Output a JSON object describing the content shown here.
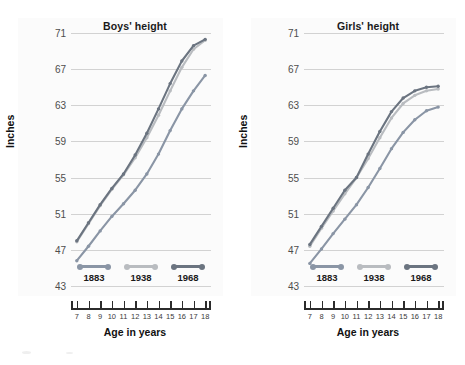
{
  "figure": {
    "background": "#ffffff",
    "panel_background": "#fbfbfb",
    "gridline_color": "#d2d2d2",
    "axis_color": "#2b2b2b"
  },
  "series_colors": {
    "1883": "#8a95a5",
    "1938": "#b9bcc0",
    "1968": "#6b7480"
  },
  "legend": {
    "items": [
      {
        "label": "1883",
        "color": "#8a95a5"
      },
      {
        "label": "1938",
        "color": "#b9bcc0"
      },
      {
        "label": "1968",
        "color": "#6b7480"
      }
    ]
  },
  "axes": {
    "ylabel": "Inches",
    "xlabel": "Age in years",
    "yticks": [
      43,
      47,
      51,
      55,
      59,
      63,
      67,
      71
    ],
    "ylim": [
      43,
      71
    ],
    "xticks": [
      7,
      8,
      9,
      10,
      11,
      12,
      13,
      14,
      15,
      16,
      17,
      18
    ],
    "xlim": [
      6.5,
      18.5
    ]
  },
  "chart_data": [
    {
      "type": "line",
      "title": "Boys' height",
      "xlabel": "Age in years",
      "ylabel": "Inches",
      "ylim": [
        43,
        71
      ],
      "xlim": [
        6.5,
        18.5
      ],
      "grid": true,
      "legend_position": "bottom",
      "x": [
        7,
        8,
        9,
        10,
        11,
        12,
        13,
        14,
        15,
        16,
        17,
        18
      ],
      "series": [
        {
          "name": "1883",
          "color": "#8a95a5",
          "values": [
            45.8,
            47.4,
            49.1,
            50.7,
            52.1,
            53.6,
            55.4,
            57.6,
            60.2,
            62.6,
            64.6,
            66.3
          ]
        },
        {
          "name": "1938",
          "color": "#b9bcc0",
          "values": [
            47.9,
            49.9,
            51.9,
            53.7,
            55.3,
            57.2,
            59.4,
            61.9,
            64.6,
            67.2,
            69.2,
            70.2
          ]
        },
        {
          "name": "1968",
          "color": "#6b7480",
          "values": [
            48.0,
            50.0,
            52.0,
            53.8,
            55.4,
            57.5,
            59.9,
            62.6,
            65.4,
            67.9,
            69.6,
            70.3
          ]
        }
      ]
    },
    {
      "type": "line",
      "title": "Girls' height",
      "xlabel": "Age in years",
      "ylabel": "Inches",
      "ylim": [
        43,
        71
      ],
      "xlim": [
        6.5,
        18.5
      ],
      "grid": true,
      "legend_position": "bottom",
      "x": [
        7,
        8,
        9,
        10,
        11,
        12,
        13,
        14,
        15,
        16,
        17,
        18
      ],
      "series": [
        {
          "name": "1883",
          "color": "#8a95a5",
          "values": [
            45.5,
            47.1,
            48.8,
            50.4,
            52.0,
            53.9,
            56.0,
            58.2,
            60.0,
            61.4,
            62.4,
            62.8
          ]
        },
        {
          "name": "1938",
          "color": "#b9bcc0",
          "values": [
            47.4,
            49.4,
            51.3,
            53.2,
            55.0,
            57.1,
            59.4,
            61.6,
            63.2,
            64.1,
            64.6,
            64.8
          ]
        },
        {
          "name": "1968",
          "color": "#6b7480",
          "values": [
            47.6,
            49.6,
            51.6,
            53.6,
            55.0,
            57.6,
            60.1,
            62.3,
            63.8,
            64.6,
            65.0,
            65.1
          ]
        }
      ]
    }
  ]
}
